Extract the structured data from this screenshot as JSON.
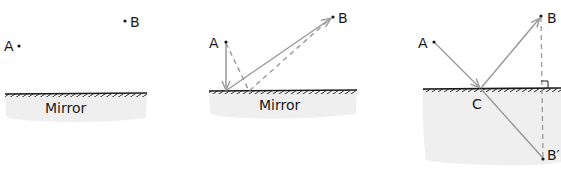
{
  "colors": {
    "ink": "#1a1a1a",
    "ray": "#9a9a9a",
    "mirror_fill": "#efefef",
    "background": "#ffffff"
  },
  "panels": [
    {
      "id": "panel-1",
      "points": {
        "A": "A",
        "B": "B"
      },
      "mirror_label": "Mirror"
    },
    {
      "id": "panel-2",
      "points": {
        "A": "A",
        "B": "B"
      },
      "mirror_label": "Mirror"
    },
    {
      "id": "panel-3",
      "points": {
        "A": "A",
        "B": "B",
        "C": "C",
        "B_prime": "B′"
      }
    }
  ]
}
